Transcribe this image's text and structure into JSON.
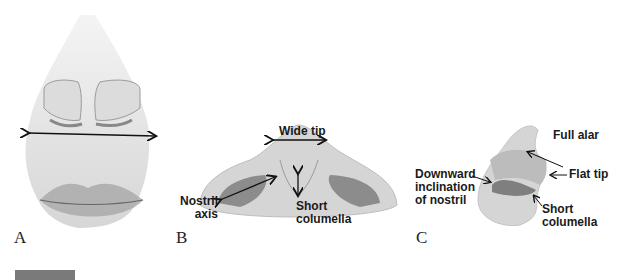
{
  "figure": {
    "panels": [
      {
        "id": "A",
        "label": "A",
        "annotations": []
      },
      {
        "id": "B",
        "label": "B",
        "annotations": [
          {
            "text": "Wide tip"
          },
          {
            "text": "Nostril\naxis"
          },
          {
            "text": "Short\ncolumella"
          }
        ]
      },
      {
        "id": "C",
        "label": "C",
        "annotations": [
          {
            "text": "Full alar"
          },
          {
            "text": "Flat tip"
          },
          {
            "text": "Downward\ninclination\nof nostril"
          },
          {
            "text": "Short\ncolumella"
          }
        ]
      }
    ],
    "colors": {
      "skin": "#d9d9d9",
      "skin_dark": "#a8a8a8",
      "nostril": "#8c8c8c",
      "lip": "#9a9a9a",
      "arrow": "#111111",
      "figure_bar": "#7a7a7a"
    }
  }
}
